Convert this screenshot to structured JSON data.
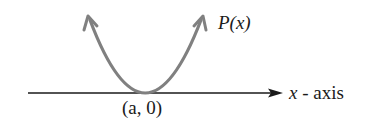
{
  "diagram": {
    "curve_label": "P(x)",
    "axis_label_var": "x",
    "axis_label_rest": " - axis",
    "point_label": "(a, 0)",
    "colors": {
      "curve": "#808080",
      "axis": "#1a1a1a",
      "text": "#1a1a1a"
    }
  }
}
